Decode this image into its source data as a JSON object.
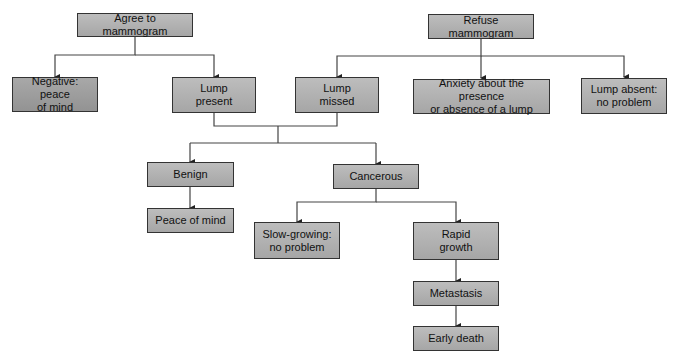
{
  "nodes": {
    "agree": "Agree to mammogram",
    "refuse": "Refuse mammogram",
    "negative": "Negative: peace\nof mind",
    "lump_present": "Lump\npresent",
    "lump_missed": "Lump\nmissed",
    "anxiety": "Anxiety about the presence\nor absence of a lump",
    "lump_absent": "Lump absent:\nno problem",
    "benign": "Benign",
    "cancerous": "Cancerous",
    "peace_of_mind": "Peace of mind",
    "slow_growing": "Slow-growing:\nno problem",
    "rapid_growth": "Rapid\ngrowth",
    "metastasis": "Metastasis",
    "early_death": "Early death"
  },
  "edges": [
    [
      "agree",
      "negative"
    ],
    [
      "agree",
      "lump_present"
    ],
    [
      "refuse",
      "lump_missed"
    ],
    [
      "refuse",
      "anxiety"
    ],
    [
      "refuse",
      "lump_absent"
    ],
    [
      "lump_present",
      "benign"
    ],
    [
      "lump_present",
      "cancerous"
    ],
    [
      "lump_missed",
      "benign"
    ],
    [
      "lump_missed",
      "cancerous"
    ],
    [
      "benign",
      "peace_of_mind"
    ],
    [
      "cancerous",
      "slow_growing"
    ],
    [
      "cancerous",
      "rapid_growth"
    ],
    [
      "rapid_growth",
      "metastasis"
    ],
    [
      "metastasis",
      "early_death"
    ]
  ]
}
